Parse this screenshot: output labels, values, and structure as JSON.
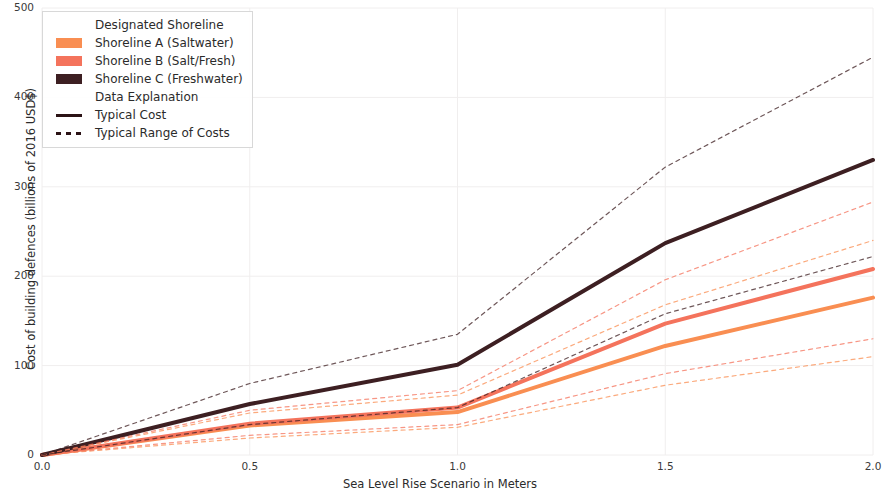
{
  "chart_data": {
    "type": "line",
    "title": "",
    "xlabel": "Sea Level Rise Scenario in Meters",
    "ylabel": "Cost of building defences (billions of 2016 USD$)",
    "x": [
      0.0,
      0.5,
      1.0,
      1.5,
      2.0
    ],
    "xlim": [
      0.0,
      2.0
    ],
    "ylim": [
      0,
      500
    ],
    "xticks": [
      "0.0",
      "0.5",
      "1.0",
      "1.5",
      "2.0"
    ],
    "yticks": [
      "0",
      "100",
      "200",
      "300",
      "400",
      "500"
    ],
    "grid": true,
    "legend_position": "upper left",
    "legend_title": "Designated Shoreline",
    "legend_subtitle": "Data Explanation",
    "series": [
      {
        "name": "Shoreline A (Saltwater)",
        "color": "#F98E52",
        "style": "solid",
        "role": "Typical Cost",
        "values": [
          0,
          33,
          48,
          122,
          176
        ]
      },
      {
        "name": "Shoreline B (Salt/Fresh)",
        "color": "#F4735C",
        "style": "solid",
        "role": "Typical Cost",
        "values": [
          0,
          35,
          53,
          147,
          208
        ]
      },
      {
        "name": "Shoreline C (Freshwater)",
        "color": "#3D1F22",
        "style": "solid",
        "role": "Typical Cost",
        "values": [
          0,
          57,
          101,
          237,
          330
        ]
      },
      {
        "name": "Shoreline A (Saltwater) upper range",
        "color": "#F98E52",
        "style": "dashed",
        "role": "Typical Range of Costs",
        "values": [
          0,
          47,
          67,
          168,
          240
        ]
      },
      {
        "name": "Shoreline A (Saltwater) lower range",
        "color": "#F98E52",
        "style": "dashed",
        "role": "Typical Range of Costs",
        "values": [
          0,
          19,
          31,
          78,
          110
        ]
      },
      {
        "name": "Shoreline B (Salt/Fresh) upper range",
        "color": "#F4735C",
        "style": "dashed",
        "role": "Typical Range of Costs",
        "values": [
          0,
          50,
          72,
          196,
          283
        ]
      },
      {
        "name": "Shoreline B (Salt/Fresh) lower range",
        "color": "#F4735C",
        "style": "dashed",
        "role": "Typical Range of Costs",
        "values": [
          0,
          22,
          34,
          91,
          130
        ]
      },
      {
        "name": "Shoreline C (Freshwater) upper range",
        "color": "#3D1F22",
        "style": "dashed",
        "role": "Typical Range of Costs",
        "values": [
          0,
          80,
          135,
          322,
          445
        ]
      },
      {
        "name": "Shoreline C (Freshwater) lower range",
        "color": "#3D1F22",
        "style": "dashed",
        "role": "Typical Range of Costs",
        "values": [
          0,
          34,
          53,
          158,
          222
        ]
      }
    ]
  },
  "legend": {
    "title": "Designated Shoreline",
    "items": [
      {
        "label": "Shoreline A (Saltwater)",
        "color": "#F98E52",
        "key": "swatch"
      },
      {
        "label": "Shoreline B (Salt/Fresh)",
        "color": "#F4735C",
        "key": "swatch"
      },
      {
        "label": "Shoreline C (Freshwater)",
        "color": "#3D1F22",
        "key": "swatch"
      }
    ],
    "subtitle": "Data Explanation",
    "styles": [
      {
        "label": "Typical Cost",
        "key": "solid-line"
      },
      {
        "label": "Typical Range of Costs",
        "key": "dotted-line"
      }
    ]
  },
  "axes": {
    "y_label": "Cost of building defences (billions of 2016 USD$)",
    "x_label": "Sea Level Rise Scenario in Meters"
  }
}
